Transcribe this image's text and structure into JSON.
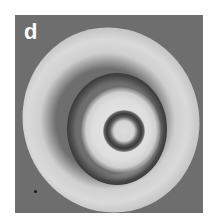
{
  "figure": {
    "panel_label": "d",
    "image_type": "grayscale concentric ring pattern",
    "colors": {
      "background": "#6e6e6e",
      "bright_ring": "#d6d6d6",
      "dark_ring": "#3c3c3c",
      "label": "#ffffff"
    }
  }
}
